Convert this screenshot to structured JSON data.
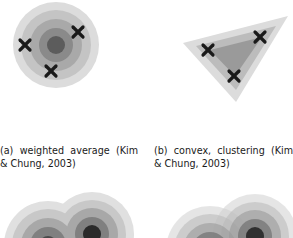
{
  "figures": [
    {
      "id": "a",
      "caption": "(a) weighted average (Kim & Chung, 2003)",
      "shape": "concentric-circles",
      "center": [
        56,
        45
      ],
      "rings": [
        {
          "r": 43,
          "color": "#dcdcdc"
        },
        {
          "r": 35,
          "color": "#c4c4c4"
        },
        {
          "r": 26,
          "color": "#a9a9a9"
        },
        {
          "r": 17,
          "color": "#8a8a8a"
        },
        {
          "r": 9,
          "color": "#5c5c5c"
        }
      ],
      "markers": [
        [
          25,
          45
        ],
        [
          78,
          32
        ],
        [
          51,
          71
        ]
      ]
    },
    {
      "id": "b",
      "caption": "(b) convex, clustering (Kim & Chung, 2003)",
      "shape": "nested-triangles",
      "layers": [
        {
          "points": "183,43 288,16 236,102",
          "color": "#dcdcdc"
        },
        {
          "points": "196,46 276,26 236,90",
          "color": "#bcbcbc"
        },
        {
          "points": "210,50 262,37 235,76",
          "color": "#9a9a9a"
        }
      ],
      "markers": [
        [
          208,
          50
        ],
        [
          260,
          37
        ],
        [
          234,
          76
        ]
      ]
    },
    {
      "id": "c",
      "shape": "overlapping-circle-clusters",
      "clusters": [
        {
          "center": [
            48,
            245
          ],
          "rings": [
            44,
            36,
            27,
            18,
            9
          ]
        },
        {
          "center": [
            92,
            234
          ],
          "rings": [
            42,
            34,
            26,
            17,
            9
          ]
        }
      ]
    },
    {
      "id": "d",
      "shape": "overlapping-circle-clusters",
      "clusters": [
        {
          "center": [
            210,
            250
          ],
          "rings": [
            44,
            36,
            27,
            18,
            9
          ]
        },
        {
          "center": [
            255,
            236
          ],
          "rings": [
            42,
            34,
            26,
            17,
            9
          ]
        }
      ]
    }
  ],
  "colors": {
    "ring1": "#dcdcdc",
    "ring2": "#c4c4c4",
    "ring3": "#a9a9a9",
    "ring4": "#8a8a8a",
    "ring5": "#5c5c5c",
    "marker": "#1a1a1a"
  }
}
